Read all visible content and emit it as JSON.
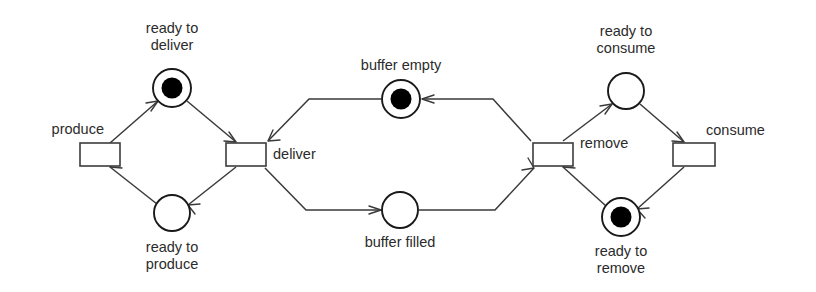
{
  "diagram": {
    "kind": "petri-net",
    "colors": {
      "background": "#ffffff",
      "stroke": "#3a3a3a",
      "place_stroke": "#1a1a1a",
      "token": "#000000",
      "label": "#2b2b2b"
    },
    "places": [
      {
        "id": "ready-to-deliver",
        "label_line1": "ready to",
        "label_line2": "deliver",
        "tokens": 1,
        "cx": 172,
        "cy": 88,
        "r": 19,
        "label_anchor": "middle",
        "label_x": 172,
        "label_y1": 29,
        "label_y2": 46
      },
      {
        "id": "ready-to-produce",
        "label_line1": "ready to",
        "label_line2": "produce",
        "tokens": 0,
        "cx": 172,
        "cy": 213,
        "r": 18,
        "label_anchor": "middle",
        "label_x": 172,
        "label_y1": 248,
        "label_y2": 265
      },
      {
        "id": "buffer-empty",
        "label_line1": "buffer empty",
        "label_line2": "",
        "tokens": 1,
        "cx": 401,
        "cy": 99,
        "r": 19,
        "label_anchor": "middle",
        "label_x": 401,
        "label_y1": 66,
        "label_y2": 0
      },
      {
        "id": "buffer-filled",
        "label_line1": "buffer filled",
        "label_line2": "",
        "tokens": 0,
        "cx": 400,
        "cy": 210,
        "r": 18,
        "label_anchor": "middle",
        "label_x": 400,
        "label_y1": 243,
        "label_y2": 0
      },
      {
        "id": "ready-to-consume",
        "label_line1": "ready to",
        "label_line2": "consume",
        "tokens": 0,
        "cx": 626,
        "cy": 91,
        "r": 18,
        "label_anchor": "middle",
        "label_x": 626,
        "label_y1": 32,
        "label_y2": 49
      },
      {
        "id": "ready-to-remove",
        "label_line1": "ready to",
        "label_line2": "remove",
        "tokens": 1,
        "cx": 621,
        "cy": 217,
        "r": 19,
        "label_anchor": "middle",
        "label_x": 621,
        "label_y1": 252,
        "label_y2": 269
      }
    ],
    "transitions": [
      {
        "id": "produce",
        "label": "produce",
        "x": 80,
        "y": 143,
        "w": 40,
        "h": 23,
        "label_anchor": "end",
        "label_x": 104,
        "label_y": 130
      },
      {
        "id": "deliver",
        "label": "deliver",
        "x": 226,
        "y": 143,
        "w": 40,
        "h": 23,
        "label_anchor": "start",
        "label_x": 273,
        "label_y": 155
      },
      {
        "id": "remove",
        "label": "remove",
        "x": 533,
        "y": 143,
        "w": 40,
        "h": 23,
        "label_anchor": "start",
        "label_x": 580,
        "label_y": 144
      },
      {
        "id": "consume",
        "label": "consume",
        "x": 673,
        "y": 143,
        "w": 42,
        "h": 23,
        "label_anchor": "start",
        "label_x": 706,
        "label_y": 131
      }
    ],
    "arcs": [
      {
        "id": "arc-produce-to-ready-to-deliver",
        "from": "produce",
        "to": "ready-to-deliver"
      },
      {
        "id": "arc-ready-to-deliver-to-deliver",
        "from": "ready-to-deliver",
        "to": "deliver"
      },
      {
        "id": "arc-deliver-to-ready-to-produce",
        "from": "deliver",
        "to": "ready-to-produce"
      },
      {
        "id": "arc-ready-to-produce-to-produce",
        "from": "ready-to-produce",
        "to": "produce"
      },
      {
        "id": "arc-buffer-empty-to-deliver",
        "from": "buffer-empty",
        "to": "deliver"
      },
      {
        "id": "arc-deliver-to-buffer-filled",
        "from": "deliver",
        "to": "buffer-filled"
      },
      {
        "id": "arc-buffer-filled-to-remove",
        "from": "buffer-filled",
        "to": "remove"
      },
      {
        "id": "arc-remove-to-buffer-empty",
        "from": "remove",
        "to": "buffer-empty"
      },
      {
        "id": "arc-remove-to-ready-to-consume",
        "from": "remove",
        "to": "ready-to-consume"
      },
      {
        "id": "arc-ready-to-consume-to-consume",
        "from": "ready-to-consume",
        "to": "consume"
      },
      {
        "id": "arc-consume-to-ready-to-remove",
        "from": "consume",
        "to": "ready-to-remove"
      },
      {
        "id": "arc-ready-to-remove-to-remove",
        "from": "ready-to-remove",
        "to": "remove"
      }
    ]
  }
}
